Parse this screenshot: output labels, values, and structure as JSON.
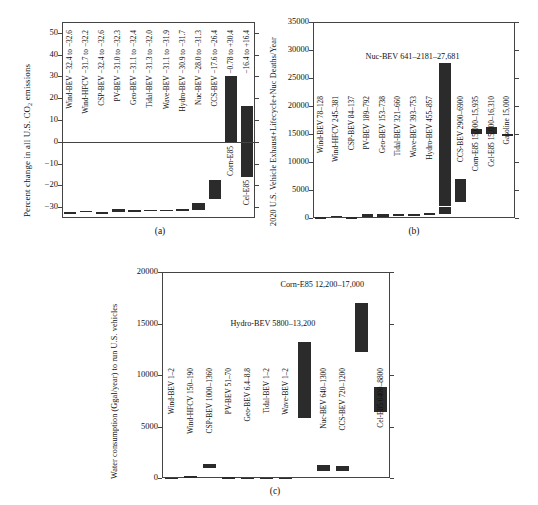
{
  "figure": {
    "panels": [
      "(a)",
      "(b)",
      "(c)"
    ]
  },
  "chart_data": [
    {
      "type": "bar",
      "panel": "(a)",
      "title": "",
      "ylabel": "Percent change in all U.S. CO2 emissions",
      "xlabel": "",
      "ylim": [
        -35,
        55
      ],
      "yticks": [
        -30,
        -20,
        -10,
        0,
        10,
        20,
        30,
        40,
        50
      ],
      "grid": false,
      "caption": "(a)",
      "categories": [
        "Wind-BEV",
        "Wind-HFCV",
        "CSP-BEV",
        "PV-BEV",
        "Geo-BEV",
        "Tidal-BEV",
        "Wave-BEV",
        "Hydro-BEV",
        "Nuc-BEV",
        "CCS-BEV",
        "Corn-E85",
        "Cel-E85"
      ],
      "bar_labels": [
        "Wind-BEV −32.4 to −32.6",
        "Wind-HFCV −31.7 to −32.2",
        "CSP-BEV −32.4 to −32.6",
        "PV-BEV −31.0 to −32.3",
        "Geo-BEV −31.1 to −32.4",
        "Tidal-BEV −31.3 to −32.0",
        "Wave-BEV −31.1 to −31.9",
        "Hydro-BEV −30.9 to −31.7",
        "Nuc-BEV −28.0 to −31.3",
        "CCS-BEV −17.6 to −26.4",
        "−0.78 to +30.4",
        "−16.4 to +16.4"
      ],
      "ranges": [
        {
          "low": -32.6,
          "high": -32.4
        },
        {
          "low": -32.2,
          "high": -31.7
        },
        {
          "low": -32.6,
          "high": -32.4
        },
        {
          "low": -32.3,
          "high": -31.0
        },
        {
          "low": -32.4,
          "high": -31.1
        },
        {
          "low": -32.0,
          "high": -31.3
        },
        {
          "low": -31.9,
          "high": -31.1
        },
        {
          "low": -31.7,
          "high": -30.9
        },
        {
          "low": -31.3,
          "high": -28.0
        },
        {
          "low": -26.4,
          "high": -17.6
        },
        {
          "low": -0.78,
          "high": 30.4
        },
        {
          "low": -16.4,
          "high": 16.4
        }
      ],
      "outer_labels": [
        "Corn-E85",
        "Cel-E85"
      ]
    },
    {
      "type": "bar",
      "panel": "(b)",
      "title": "",
      "ylabel": "2020 U.S. Vehicle Exhaust+Lifecycle+Nuc Deaths/Year",
      "xlabel": "",
      "ylim": [
        0,
        35000
      ],
      "yticks": [
        0,
        5000,
        10000,
        15000,
        20000,
        25000,
        30000,
        35000
      ],
      "grid": false,
      "caption": "(b)",
      "categories": [
        "Wind-BEV",
        "Wind-HFCV",
        "CSP-BEV",
        "PV-BEV",
        "Geo-BEV",
        "Tidal-BEV",
        "Wave-BEV",
        "Hydro-BEV",
        "Nuc-BEV",
        "CCS-BEV",
        "Corn-E85",
        "Cel-E85",
        "Gasoline"
      ],
      "bar_labels": [
        "Wind-BEV 78–128",
        "Wind-HFCV 245–381",
        "CSP-BEV 84–137",
        "PV-BEV 189–792",
        "Geo-BEV 153–738",
        "Tidal-BEV 321–660",
        "Wave-BEV 393–753",
        "Hydro-BEV 455–857",
        "",
        "CCS-BEV 2900–6900",
        "Corn-E85 15,000–15,935",
        "Cel-E85 15,000–16,310",
        "Gasoline 15,000"
      ],
      "ranges": [
        {
          "low": 78,
          "high": 128
        },
        {
          "low": 245,
          "high": 381
        },
        {
          "low": 84,
          "high": 137
        },
        {
          "low": 189,
          "high": 792
        },
        {
          "low": 153,
          "high": 738
        },
        {
          "low": 321,
          "high": 660
        },
        {
          "low": 393,
          "high": 753
        },
        {
          "low": 455,
          "high": 857
        },
        {
          "low": 641,
          "mid": 2181,
          "high": 27681
        },
        {
          "low": 2900,
          "high": 6900
        },
        {
          "low": 15000,
          "high": 15935
        },
        {
          "low": 15000,
          "high": 16310
        },
        {
          "low": 15000,
          "high": 15000
        }
      ],
      "annotations": [
        {
          "text": "Nuc-BEV 641–2181–27,681",
          "x": 0.26,
          "y": 28600
        }
      ]
    },
    {
      "type": "bar",
      "panel": "(c)",
      "title": "",
      "ylabel": "Water consumption (Ggal/year) to run U.S. vehicles",
      "xlabel": "",
      "ylim": [
        0,
        20000
      ],
      "yticks": [
        0,
        5000,
        10000,
        15000,
        20000
      ],
      "grid": false,
      "caption": "(c)",
      "categories": [
        "Wind-BEV",
        "Wind-HFCV",
        "CSP-BEV",
        "PV-BEV",
        "Geo-BEV",
        "Tidal-BEV",
        "Wave-BEV",
        "Hydro-BEV",
        "Nuc-BEV",
        "CCS-BEV",
        "Corn-E85",
        "Cel-E85"
      ],
      "bar_labels": [
        "Wind-BEV 1–2",
        "Wind-HFCV 150–190",
        "CSP-BEV 1000–1360",
        "PV-BEV 51–70",
        "Geo-BEV 6.4–8.8",
        "Tidal-BEV 1–2",
        "Wave-BEV 1–2",
        "",
        "Nuc-BEV 640–1300",
        "CCS-BEV 720–1200",
        "",
        "Cel-E85 6400–8800"
      ],
      "ranges": [
        {
          "low": 1,
          "high": 2
        },
        {
          "low": 150,
          "high": 190
        },
        {
          "low": 1000,
          "high": 1360
        },
        {
          "low": 51,
          "high": 70
        },
        {
          "low": 6.4,
          "high": 8.8
        },
        {
          "low": 1,
          "high": 2
        },
        {
          "low": 1,
          "high": 2
        },
        {
          "low": 5800,
          "high": 13200
        },
        {
          "low": 640,
          "high": 1300
        },
        {
          "low": 720,
          "high": 1200
        },
        {
          "low": 12200,
          "high": 17000
        },
        {
          "low": 6400,
          "high": 8800
        }
      ],
      "annotations": [
        {
          "text": "Corn-E85 12,200–17,000",
          "x": 0.52,
          "y": 18600
        },
        {
          "text": "Hydro-BEV 5800–13,200",
          "x": 0.3,
          "y": 14900
        }
      ]
    }
  ]
}
